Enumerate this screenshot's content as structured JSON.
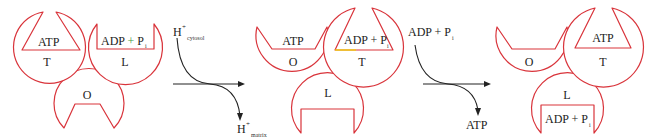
{
  "colors": {
    "subunit_outline": "#d9343b",
    "plus_highlight": "#3a9a3a",
    "edge_highlight": "#f2d300",
    "text": "#222222",
    "arrow": "#222222"
  },
  "states": [
    {
      "subunits": [
        {
          "state": "T",
          "bound": "ATP"
        },
        {
          "state": "L",
          "bound": "ADP + P",
          "bound_sub": "i"
        },
        {
          "state": "O",
          "bound": ""
        }
      ]
    },
    {
      "subunits": [
        {
          "state": "O",
          "bound": "ATP"
        },
        {
          "state": "T",
          "bound": "ADP + P",
          "bound_sub": "i"
        },
        {
          "state": "L",
          "bound": ""
        }
      ]
    },
    {
      "subunits": [
        {
          "state": "O",
          "bound": ""
        },
        {
          "state": "T",
          "bound": "ATP"
        },
        {
          "state": "L",
          "bound": "ADP + P",
          "bound_sub": "i"
        }
      ]
    }
  ],
  "transitions": [
    {
      "input": {
        "base": "H",
        "sup": "+",
        "sub": "cytosol"
      },
      "output": {
        "base": "H",
        "sup": "+",
        "sub": "matrix"
      }
    },
    {
      "input": {
        "base": "ADP + P",
        "sub": "i"
      },
      "output": {
        "base": "ATP"
      }
    }
  ]
}
